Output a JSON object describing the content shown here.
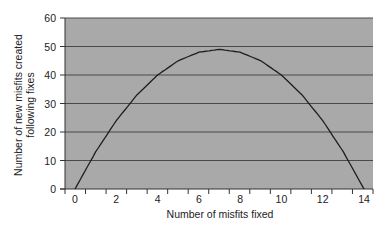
{
  "chart_data": {
    "type": "line",
    "title": "",
    "xlabel": "Number of misfits fixed",
    "ylabel": "Number of new misfits created following fixes",
    "ylabel_lines": [
      "Number of new misfits created",
      "following fixes"
    ],
    "xlim": [
      0,
      14
    ],
    "ylim": [
      0,
      60
    ],
    "x_ticks": [
      0,
      2,
      4,
      6,
      8,
      10,
      12,
      14
    ],
    "y_ticks": [
      0,
      10,
      20,
      30,
      40,
      50,
      60
    ],
    "grid": true,
    "legend": null,
    "series": [
      {
        "name": "New misfits created",
        "x": [
          0,
          1,
          2,
          3,
          4,
          5,
          6,
          7,
          8,
          9,
          10,
          11,
          12,
          13,
          14
        ],
        "values": [
          0,
          13,
          24,
          33,
          40,
          45,
          48,
          49,
          48,
          45,
          40,
          33,
          24,
          13,
          0
        ]
      }
    ],
    "colors": {
      "plot_background": "#a9a9a9",
      "gridline": "#4a4a4a",
      "line": "#1e1e1e"
    }
  }
}
